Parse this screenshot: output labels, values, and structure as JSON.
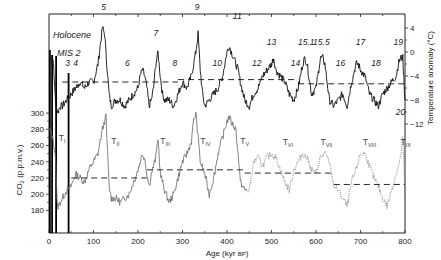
{
  "chart_data": [
    {
      "type": "line",
      "title": "",
      "panel": "top",
      "xlabel": "Age (kyr BP)",
      "ylabel": "Temperature anomaly (°C)",
      "y_axis_side": "right",
      "xlim": [
        0,
        800
      ],
      "ylim": [
        -12,
        4
      ],
      "yticks": [
        4,
        0,
        -4,
        -8,
        -12
      ],
      "grid": false,
      "series": [
        {
          "name": "Temperature anomaly",
          "color": "#111111",
          "x": [
            0,
            5,
            10,
            15,
            20,
            25,
            30,
            40,
            50,
            60,
            70,
            80,
            90,
            100,
            110,
            115,
            120,
            125,
            130,
            135,
            140,
            150,
            160,
            170,
            180,
            190,
            200,
            205,
            210,
            215,
            220,
            225,
            230,
            235,
            240,
            245,
            250,
            255,
            260,
            270,
            280,
            290,
            300,
            310,
            320,
            325,
            330,
            335,
            340,
            345,
            350,
            360,
            370,
            380,
            390,
            400,
            405,
            410,
            415,
            420,
            425,
            430,
            440,
            450,
            460,
            470,
            480,
            490,
            500,
            505,
            510,
            520,
            530,
            540,
            550,
            560,
            570,
            575,
            580,
            590,
            600,
            610,
            615,
            620,
            630,
            640,
            650,
            660,
            670,
            680,
            690,
            695,
            700,
            710,
            720,
            730,
            740,
            750,
            760,
            770,
            780,
            785,
            790,
            795,
            800
          ],
          "values": [
            0,
            -1,
            -2,
            -9,
            -10,
            -9,
            -9,
            -8,
            -7,
            -6,
            -5,
            -6,
            -5,
            -5,
            -2,
            1,
            4,
            3,
            -2,
            -7,
            -9,
            -8,
            -8,
            -9,
            -8,
            -7,
            -6,
            -4,
            -3,
            -4,
            -6,
            -9,
            -8,
            -6,
            -2,
            0,
            -4,
            -7,
            -8,
            -8,
            -9,
            -7,
            -5,
            -6,
            -4,
            -2,
            0,
            3,
            -3,
            -7,
            -9,
            -8,
            -7,
            -6,
            -4,
            0,
            1,
            0,
            -1,
            -2,
            -3,
            -5,
            -8,
            -9,
            -7,
            -6,
            -4,
            -3,
            -2,
            -1,
            -3,
            -4,
            -5,
            -7,
            -8,
            -6,
            -2,
            -1,
            -2,
            -7,
            -6,
            -1,
            -1,
            -2,
            -8,
            -9,
            -8,
            -7,
            -9,
            -5,
            -2,
            -2,
            -3,
            -4,
            -7,
            -8,
            -9,
            -7,
            -6,
            -5,
            -4,
            -2,
            -1,
            -1,
            -8
          ]
        },
        {
          "name": "Mean (dashed)",
          "style": "dashed",
          "color": "#111111",
          "segments": [
            {
              "x": [
                30,
                290
              ],
              "values": [
                -5,
                -5
              ]
            },
            {
              "x": [
                290,
                560
              ],
              "values": [
                -4.6,
                -4.6
              ]
            },
            {
              "x": [
                560,
                800
              ],
              "values": [
                -5.3,
                -5.3
              ]
            }
          ]
        }
      ],
      "annotations": [
        {
          "text": "Holocene",
          "x": 8,
          "y": 3.5
        },
        {
          "text": "MIS 2",
          "x": 14,
          "y": 0.4
        },
        {
          "text": "3",
          "x": 42,
          "y": -2.3
        },
        {
          "text": "4",
          "x": 60,
          "y": -2.3
        },
        {
          "text": "5",
          "x": 123,
          "y": 7
        },
        {
          "text": "6",
          "x": 176,
          "y": -2.3
        },
        {
          "text": "7",
          "x": 240,
          "y": 2.7
        },
        {
          "text": "8",
          "x": 283,
          "y": -2.3
        },
        {
          "text": "9",
          "x": 333,
          "y": 7
        },
        {
          "text": "10",
          "x": 378,
          "y": -2.3
        },
        {
          "text": "11",
          "x": 423,
          "y": 5.5
        },
        {
          "text": "12",
          "x": 467,
          "y": -2.3
        },
        {
          "text": "13",
          "x": 500,
          "y": 1.2
        },
        {
          "text": "14",
          "x": 554,
          "y": -2.3
        },
        {
          "text": "15.1",
          "x": 578,
          "y": 1.2
        },
        {
          "text": "15.5",
          "x": 612,
          "y": 1.2
        },
        {
          "text": "16",
          "x": 655,
          "y": -2.3
        },
        {
          "text": "17",
          "x": 700,
          "y": 1.2
        },
        {
          "text": "18",
          "x": 735,
          "y": -2.3
        },
        {
          "text": "19",
          "x": 785,
          "y": 1.2
        },
        {
          "text": "20",
          "x": 790,
          "y": -10.5
        }
      ]
    },
    {
      "type": "line",
      "title": "",
      "panel": "bottom",
      "xlabel": "Age (kyr BP)",
      "ylabel": "CO2 (p.p.m.v.)",
      "y_axis_side": "left",
      "xlim": [
        0,
        800
      ],
      "ylim": [
        165,
        305
      ],
      "yticks": [
        180,
        200,
        220,
        240,
        260,
        280,
        300
      ],
      "xticks": [
        0,
        100,
        200,
        300,
        400,
        500,
        600,
        700,
        800
      ],
      "grid": false,
      "series": [
        {
          "name": "CO2",
          "color": "#555555",
          "x": [
            0,
            5,
            10,
            15,
            18,
            20,
            25,
            30,
            40,
            50,
            60,
            70,
            80,
            90,
            100,
            110,
            115,
            120,
            125,
            128,
            130,
            135,
            140,
            150,
            160,
            170,
            180,
            190,
            200,
            210,
            215,
            220,
            225,
            230,
            240,
            245,
            250,
            260,
            270,
            280,
            290,
            300,
            310,
            320,
            325,
            330,
            335,
            340,
            350,
            360,
            370,
            380,
            390,
            400,
            405,
            410,
            420,
            425,
            430,
            440,
            450,
            460,
            470,
            480,
            490,
            500,
            510,
            520,
            530,
            540,
            550,
            560,
            570,
            580,
            590,
            600,
            610,
            620,
            630,
            640,
            650,
            660,
            670,
            680,
            690,
            700,
            710,
            720,
            730,
            740,
            750,
            760,
            770,
            780,
            790,
            795,
            800
          ],
          "values": [
            280,
            275,
            265,
            245,
            190,
            185,
            190,
            195,
            205,
            210,
            225,
            220,
            215,
            230,
            240,
            250,
            265,
            280,
            290,
            295,
            270,
            210,
            195,
            195,
            190,
            195,
            200,
            215,
            230,
            250,
            245,
            225,
            210,
            225,
            245,
            270,
            225,
            205,
            190,
            200,
            220,
            240,
            250,
            265,
            290,
            300,
            270,
            240,
            225,
            200,
            220,
            250,
            270,
            290,
            295,
            288,
            280,
            250,
            215,
            205,
            205,
            240,
            245,
            235,
            245,
            250,
            245,
            230,
            215,
            205,
            230,
            240,
            250,
            245,
            230,
            225,
            245,
            250,
            240,
            210,
            205,
            195,
            185,
            215,
            230,
            250,
            250,
            235,
            220,
            210,
            195,
            185,
            205,
            225,
            245,
            270,
            195
          ]
        },
        {
          "name": "Mean (dashed)",
          "style": "dashed",
          "color": "#111111",
          "segments": [
            {
              "x": [
                50,
                220
              ],
              "values": [
                220,
                220
              ]
            },
            {
              "x": [
                220,
                440
              ],
              "values": [
                230,
                230
              ]
            },
            {
              "x": [
                440,
                640
              ],
              "values": [
                226,
                226
              ]
            },
            {
              "x": [
                640,
                800
              ],
              "values": [
                212,
                212
              ]
            }
          ]
        }
      ],
      "annotations": [
        {
          "text": "TI",
          "x": 22,
          "y": 265
        },
        {
          "text": "TII",
          "x": 140,
          "y": 262
        },
        {
          "text": "TIII",
          "x": 250,
          "y": 262
        },
        {
          "text": "TIV",
          "x": 340,
          "y": 262
        },
        {
          "text": "TV",
          "x": 430,
          "y": 262
        },
        {
          "text": "TVI",
          "x": 525,
          "y": 260
        },
        {
          "text": "TVII",
          "x": 610,
          "y": 260
        },
        {
          "text": "TVIII",
          "x": 705,
          "y": 260
        },
        {
          "text": "TIX",
          "x": 790,
          "y": 260
        }
      ]
    }
  ],
  "labels": {
    "holocene": "Holocene",
    "mis2": "MIS 2",
    "x_axis_title": "Age (kyr",
    "x_axis_unit_small": "BP",
    "x_axis_close": ")",
    "right_axis_title": "Temperature anomaly (°C)",
    "left_axis_title": "CO",
    "left_axis_sub": "2",
    "left_axis_unit": " (p.p.m.v.)"
  }
}
